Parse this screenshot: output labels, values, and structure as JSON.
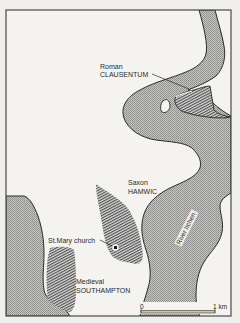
{
  "map": {
    "colors": {
      "paper": "#f1efec",
      "land": "#f4f3f0",
      "water": "#b9b9b7",
      "water_dot": "#8e8e8c",
      "hatch": "#5a5a5a",
      "outline": "#2b2b2b",
      "frame": "#4a4a4a",
      "scale_bar": "#cfc99a"
    },
    "labels": {
      "clausentum_line1": "Roman",
      "clausentum_line2": "CLAUSENTUM",
      "hamwic_line1": "Saxon",
      "hamwic_line2": "HAMWIC",
      "church": "St.Mary church",
      "southampton_line1": "Medieval",
      "southampton_line2": "SOUTHAMPTON",
      "river": "River Itchen"
    },
    "scale": {
      "start_label": "0",
      "end_label": "1 km"
    },
    "icons": {
      "church_marker": "filled-square-in-circle"
    }
  }
}
